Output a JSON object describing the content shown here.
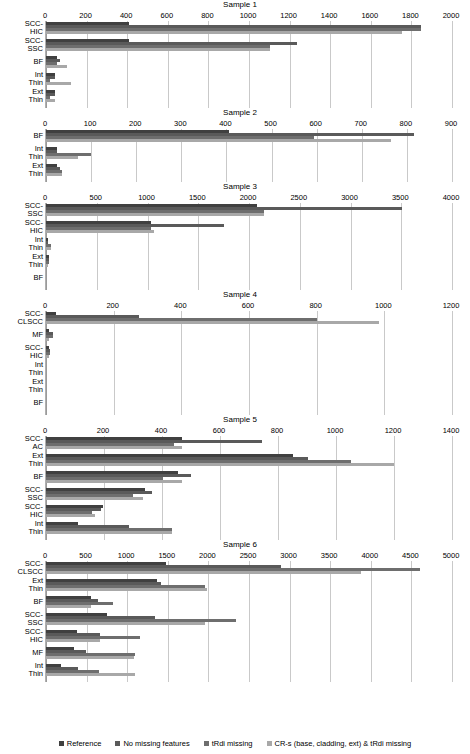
{
  "chart_data": [
    {
      "type": "bar",
      "orientation": "horizontal",
      "title": "Sample 1",
      "xlabel": "",
      "ylabel": "",
      "xlim": [
        0,
        2000
      ],
      "xticks": [
        0,
        200,
        400,
        600,
        800,
        1000,
        1200,
        1400,
        1600,
        1800,
        2000
      ],
      "grid": true,
      "categories": [
        "SCC-\nHIC",
        "SCC-\nSSC",
        "BF",
        "Int\nThin",
        "Ext\nThin"
      ],
      "series": [
        {
          "name": "Reference",
          "values": [
            410,
            410,
            55,
            45,
            45
          ]
        },
        {
          "name": "No missing features",
          "values": [
            1845,
            1235,
            70,
            45,
            45
          ]
        },
        {
          "name": "tRdi missing",
          "values": [
            1845,
            1105,
            55,
            20,
            20
          ]
        },
        {
          "name": "CR-s (base, cladding, ext) & tRdi missing",
          "values": [
            1755,
            1105,
            105,
            125,
            45
          ]
        }
      ]
    },
    {
      "type": "bar",
      "orientation": "horizontal",
      "title": "Sample 2",
      "xlabel": "",
      "ylabel": "",
      "xlim": [
        0,
        900
      ],
      "xticks": [
        0,
        100,
        200,
        300,
        400,
        500,
        600,
        700,
        800,
        900
      ],
      "grid": true,
      "categories": [
        "BF",
        "Int\nThin",
        "Ext\nThin"
      ],
      "series": [
        {
          "name": "Reference",
          "values": [
            405,
            25,
            25
          ]
        },
        {
          "name": "No missing features",
          "values": [
            815,
            25,
            30
          ]
        },
        {
          "name": "tRdi missing",
          "values": [
            595,
            100,
            35
          ]
        },
        {
          "name": "CR-s (base, cladding, ext) & tRdi missing",
          "values": [
            765,
            70,
            35
          ]
        }
      ]
    },
    {
      "type": "bar",
      "orientation": "horizontal",
      "title": "Sample 3",
      "xlabel": "",
      "ylabel": "",
      "xlim": [
        0,
        4000
      ],
      "xticks": [
        0,
        500,
        1000,
        1500,
        2000,
        2500,
        3000,
        3500,
        4000
      ],
      "grid": true,
      "categories": [
        "SCC-\nSSC",
        "SCC-\nHIC",
        "Int\nThin",
        "Ext\nThin",
        "BF"
      ],
      "series": [
        {
          "name": "Reference",
          "values": [
            2080,
            1030,
            20,
            30,
            0
          ]
        },
        {
          "name": "No missing features",
          "values": [
            3510,
            1750,
            20,
            30,
            0
          ]
        },
        {
          "name": "tRdi missing",
          "values": [
            2150,
            1030,
            50,
            30,
            0
          ]
        },
        {
          "name": "CR-s (base, cladding, ext) & tRdi missing",
          "values": [
            2150,
            1060,
            50,
            20,
            0
          ]
        }
      ]
    },
    {
      "type": "bar",
      "orientation": "horizontal",
      "title": "Sample 4",
      "xlabel": "",
      "ylabel": "",
      "xlim": [
        0,
        1200
      ],
      "xticks": [
        0,
        200,
        400,
        600,
        800,
        1000,
        1200
      ],
      "grid": true,
      "categories": [
        "SCC-\nCLSCC",
        "MF",
        "SCC-\nHIC",
        "Int\nThin",
        "Ext\nThin",
        "BF"
      ],
      "series": [
        {
          "name": "Reference",
          "values": [
            30,
            10,
            8,
            0,
            0,
            0
          ]
        },
        {
          "name": "No missing features",
          "values": [
            275,
            20,
            12,
            0,
            0,
            0
          ]
        },
        {
          "name": "tRdi missing",
          "values": [
            800,
            20,
            12,
            0,
            0,
            0
          ]
        },
        {
          "name": "CR-s (base, cladding, ext) & tRdi missing",
          "values": [
            985,
            10,
            8,
            0,
            0,
            0
          ]
        }
      ]
    },
    {
      "type": "bar",
      "orientation": "horizontal",
      "title": "Sample 5",
      "xlabel": "",
      "ylabel": "",
      "xlim": [
        0,
        1400
      ],
      "xticks": [
        0,
        200,
        400,
        600,
        800,
        1000,
        1200,
        1400
      ],
      "grid": true,
      "categories": [
        "SCC-\nAC",
        "Ext\nThin",
        "BF",
        "SCC-\nSSC",
        "SCC-\nHIC",
        "Int\nThin"
      ],
      "series": [
        {
          "name": "Reference",
          "values": [
            470,
            850,
            455,
            340,
            195,
            110
          ]
        },
        {
          "name": "No missing features",
          "values": [
            745,
            905,
            500,
            365,
            190,
            285
          ]
        },
        {
          "name": "tRdi missing",
          "values": [
            440,
            1050,
            405,
            300,
            160,
            435
          ]
        },
        {
          "name": "CR-s (base, cladding, ext) & tRdi missing",
          "values": [
            470,
            1200,
            470,
            335,
            170,
            435
          ]
        }
      ]
    },
    {
      "type": "bar",
      "orientation": "horizontal",
      "title": "Sample 6",
      "xlabel": "",
      "ylabel": "",
      "xlim": [
        0,
        5000
      ],
      "xticks": [
        0,
        500,
        1000,
        1500,
        2000,
        2500,
        3000,
        3500,
        4000,
        4500,
        5000
      ],
      "grid": true,
      "categories": [
        "SCC-\nCLSCC",
        "Ext\nThin",
        "BF",
        "SCC-\nSSC",
        "SCC-\nHIC",
        "MF",
        "Int\nThin"
      ],
      "series": [
        {
          "name": "Reference",
          "values": [
            1480,
            1370,
            560,
            750,
            380,
            350,
            180
          ]
        },
        {
          "name": "No missing features",
          "values": [
            2900,
            1420,
            640,
            1340,
            660,
            490,
            400
          ]
        },
        {
          "name": "tRdi missing",
          "values": [
            4600,
            1960,
            830,
            2340,
            1160,
            1100,
            650
          ]
        },
        {
          "name": "CR-s (base, cladding, ext) & tRdi missing",
          "values": [
            3880,
            1980,
            560,
            1960,
            660,
            1080,
            1100
          ]
        }
      ]
    }
  ],
  "legend": {
    "position": "bottom",
    "items": [
      {
        "label": "Reference",
        "color": "#404040"
      },
      {
        "label": "No missing features",
        "color": "#5a5a5a"
      },
      {
        "label": "tRdi missing",
        "color": "#6e6e6e"
      },
      {
        "label": "CR-s (base, cladding, ext) & tRdi missing",
        "color": "#a8a8a8"
      }
    ]
  },
  "colors": {
    "series": [
      "#404040",
      "#5a5a5a",
      "#6e6e6e",
      "#a8a8a8"
    ],
    "grid": "#c9c9c9",
    "axis": "#9a9a9a",
    "background": "#ffffff",
    "text": "#000000"
  }
}
